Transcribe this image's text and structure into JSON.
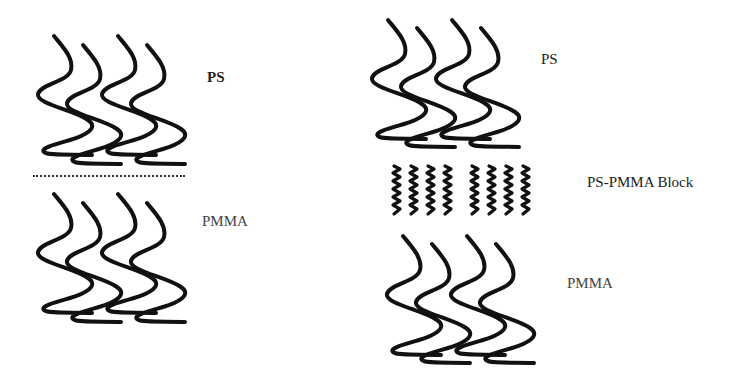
{
  "panels": [
    {
      "id": "left",
      "description": "Sharp PS / PMMA interface",
      "layers": [
        {
          "label": "PS",
          "chains": 4
        },
        {
          "label": "PMMA",
          "chains": 4
        }
      ],
      "interface": "dotted-line"
    },
    {
      "id": "right",
      "description": "PS / PMMA with block copolymer at interface",
      "layers": [
        {
          "label": "PS",
          "chains": 4
        },
        {
          "label": "PS-PMMA Block",
          "chains": 8
        },
        {
          "label": "PMMA",
          "chains": 4
        }
      ]
    }
  ],
  "labels": {
    "left_ps": "PS",
    "left_pmma": "PMMA",
    "right_ps": "PS",
    "right_block": "PS-PMMA Block",
    "right_pmma": "PMMA"
  },
  "colors": {
    "stroke": "#111111",
    "background": "#ffffff",
    "text": "#222222"
  }
}
